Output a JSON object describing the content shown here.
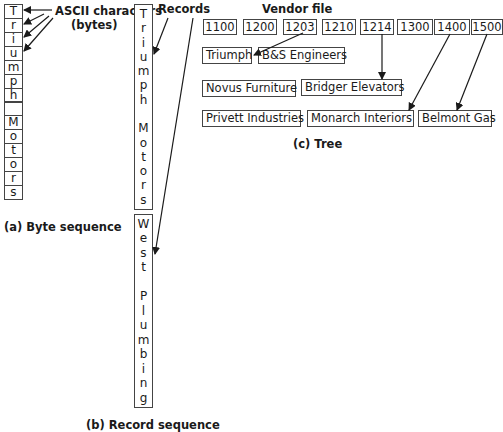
{
  "byte_sequence": {
    "caption": "(a) Byte sequence",
    "annotation_line1": "ASCII characters",
    "annotation_line2": "(bytes)",
    "bytes": [
      "T",
      "r",
      "i",
      "u",
      "m",
      "p",
      "h",
      " ",
      "M",
      "o",
      "t",
      "o",
      "r",
      "s"
    ]
  },
  "record_sequence": {
    "caption": "(b) Record sequence",
    "annotation": "Records",
    "records": [
      {
        "chars": [
          "T",
          "r",
          "i",
          "u",
          "m",
          "p",
          "h",
          " ",
          "M",
          "o",
          "t",
          "o",
          "r",
          "s"
        ]
      },
      {
        "chars": [
          "W",
          "e",
          "s",
          "t",
          " ",
          "P",
          "l",
          "u",
          "m",
          "b",
          "i",
          "n",
          "g"
        ]
      }
    ]
  },
  "tree": {
    "title": "Vendor file",
    "caption": "(c) Tree",
    "keys": [
      "1100",
      "1200",
      "1203",
      "1210",
      "1214",
      "1300",
      "1400",
      "1500"
    ],
    "row1": [
      "Triumph",
      "B&S Engineers"
    ],
    "row2": [
      "Novus Furniture",
      "Bridger Elevators"
    ],
    "row3": [
      "Privett Industries",
      "Monarch Interiors",
      "Belmont Gas"
    ]
  }
}
